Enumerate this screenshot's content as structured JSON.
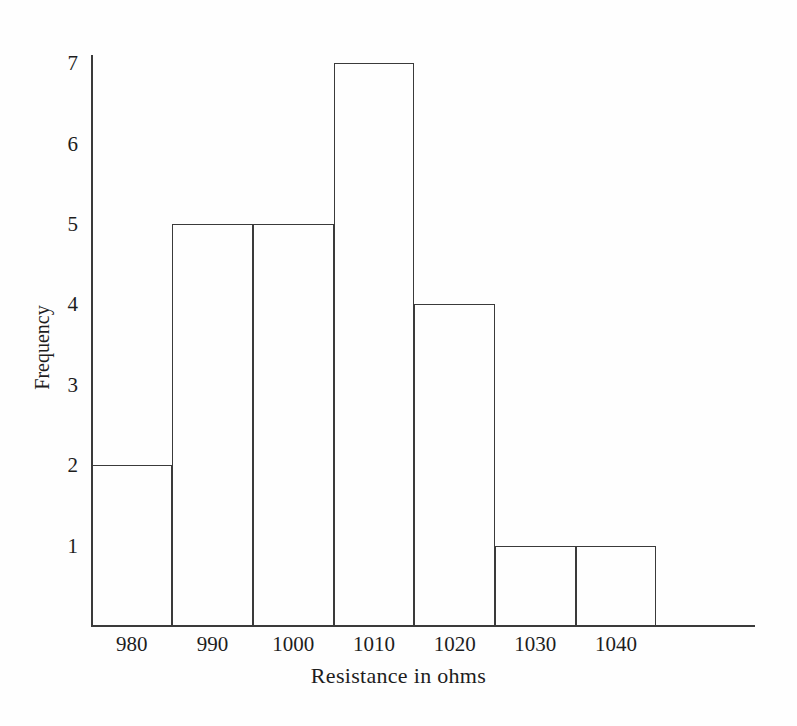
{
  "chart_data": {
    "type": "bar",
    "subtype": "histogram",
    "title": "",
    "xlabel": "Resistance in ohms",
    "ylabel": "Frequency",
    "categories": [
      "980",
      "990",
      "1000",
      "1010",
      "1020",
      "1030",
      "1040"
    ],
    "values": [
      2,
      5,
      5,
      7,
      4,
      1,
      1
    ],
    "bin_edges": [
      975,
      985,
      995,
      1005,
      1015,
      1025,
      1035,
      1045
    ],
    "bin_width": 10,
    "ytick_labels": [
      "1",
      "2",
      "3",
      "4",
      "5",
      "6",
      "7"
    ],
    "ytick_values": [
      1,
      2,
      3,
      4,
      5,
      6,
      7
    ],
    "xtick_labels": [
      "980",
      "990",
      "1000",
      "1010",
      "1020",
      "1030",
      "1040"
    ],
    "ylim": [
      0,
      7.5
    ],
    "xlim": [
      975,
      1053
    ],
    "grid": false,
    "legend": null,
    "bar_fill": "none",
    "bar_edge_color": "#3a3a3a",
    "axis_color": "#3a3a3a",
    "background": "#ffffff",
    "total_frequency": 25
  },
  "axes": {
    "x_title": "Resistance in ohms",
    "y_title": "Frequency"
  }
}
